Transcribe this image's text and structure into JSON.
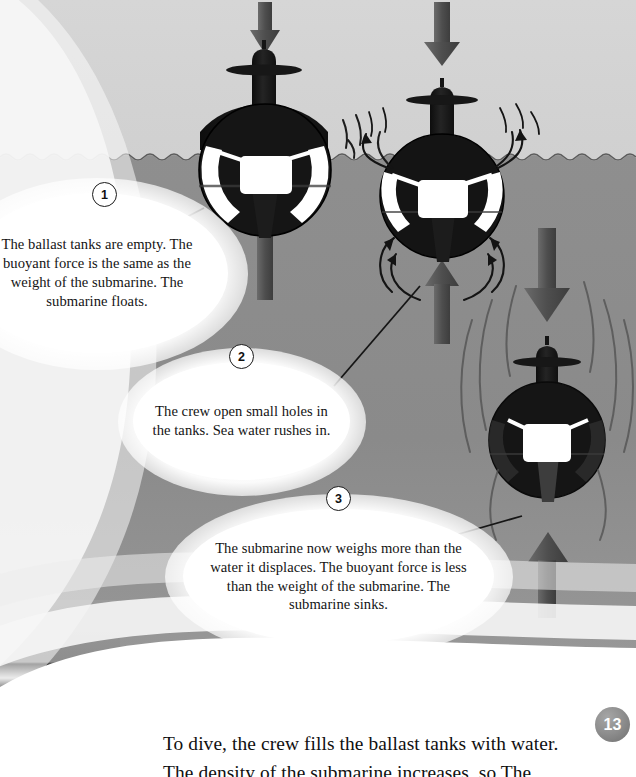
{
  "page": {
    "number": "13",
    "body_lines": [
      "To dive, the crew fills the ballast tanks with water.",
      "The density of the submarine increases, so The"
    ]
  },
  "diagram": {
    "waterline_label": "sea surface",
    "steps": [
      {
        "number": "1",
        "text": "The ballast tanks are empty. The buoyant force is the same as the weight of the submarine. The submarine floats.",
        "submarine_state": "floating-at-surface"
      },
      {
        "number": "2",
        "text": "The crew open small holes in the tanks. Sea water rushes in.",
        "submarine_state": "flooding-partly-submerged"
      },
      {
        "number": "3",
        "text": "The submarine now weighs more than the water it displaces. The buoyant force is less than the weight of the submarine. The submarine sinks.",
        "submarine_state": "sinking-fully-submerged"
      }
    ],
    "force_arrows": {
      "down_label": "weight",
      "up_label": "buoyant force"
    }
  },
  "colors": {
    "sky": "#d4d4d4",
    "sea": "#8b8b8b",
    "sea_deep": "#848484",
    "hull": "#171717",
    "hull_mid": "#2a2a2a",
    "tank_white": "#ffffff",
    "arrow_gray": "#5e5e5e",
    "arrow_gray_dark": "#4a4a4a",
    "text": "#111111",
    "page_badge": "#8e8e8e",
    "swoosh": "#f2f2f2"
  }
}
